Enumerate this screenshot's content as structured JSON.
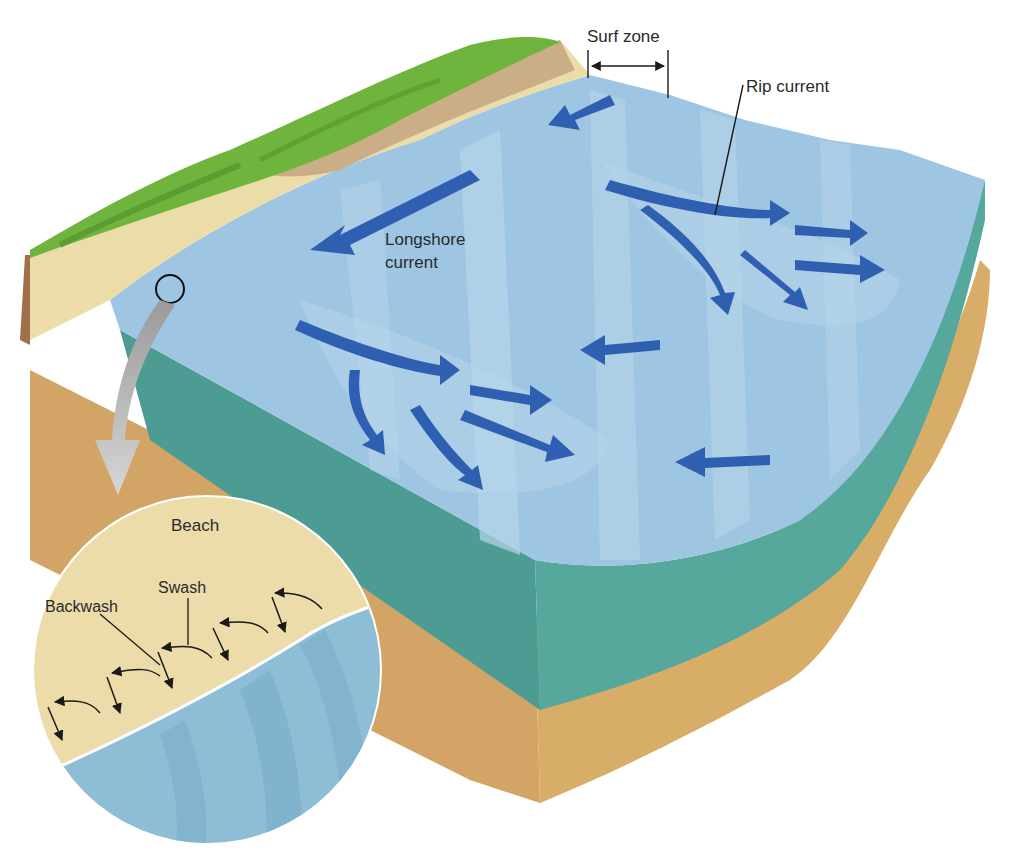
{
  "labels": {
    "surf_zone": "Surf zone",
    "rip_current": "Rip current",
    "longshore_current": "Longshore current",
    "longshore_line1": "Longshore",
    "longshore_line2": "current",
    "beach": "Beach",
    "swash": "Swash",
    "backwash": "Backwash"
  },
  "colors": {
    "water_surface": "#9ec6e2",
    "water_band_light": "#b8d6ec",
    "water_side": "#4d9c93",
    "sediment": "#d6a964",
    "grass": "#6fb43c",
    "cliff": "#cdb28c",
    "beach_sand": "#ecdca8",
    "current_arrow": "#2f5fb0",
    "leader_line": "#1a1a1a"
  }
}
